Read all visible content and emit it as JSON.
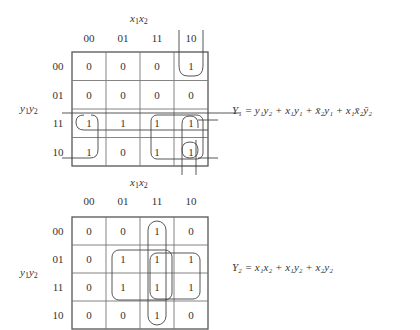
{
  "maps": [
    {
      "id": "Y1",
      "column_var_label": "x1x2",
      "row_var_label": "y1y2",
      "column_headers": [
        "00",
        "01",
        "11",
        "10"
      ],
      "row_headers": [
        "00",
        "01",
        "11",
        "10"
      ],
      "cells": [
        [
          "0",
          "0",
          "0",
          "1"
        ],
        [
          "0",
          "0",
          "0",
          "0"
        ],
        [
          "1",
          "1",
          "1",
          "1"
        ],
        [
          "1",
          "0",
          "1",
          "1"
        ]
      ],
      "equation": "Y₁ = y₁y₂ + x₁y₁ + x̄₂y₁ + x₁x̄₂ȳ₂"
    },
    {
      "id": "Y2",
      "column_var_label": "x1x2",
      "row_var_label": "y1y2",
      "column_headers": [
        "00",
        "01",
        "11",
        "10"
      ],
      "row_headers": [
        "00",
        "01",
        "11",
        "10"
      ],
      "cells": [
        [
          "0",
          "0",
          "1",
          "0"
        ],
        [
          "0",
          "1",
          "1",
          "1"
        ],
        [
          "0",
          "1",
          "1",
          "1"
        ],
        [
          "0",
          "0",
          "1",
          "0"
        ]
      ],
      "equation": "Y₂ = x₁x₂ + x₁y₂ + x₂y₂"
    }
  ]
}
